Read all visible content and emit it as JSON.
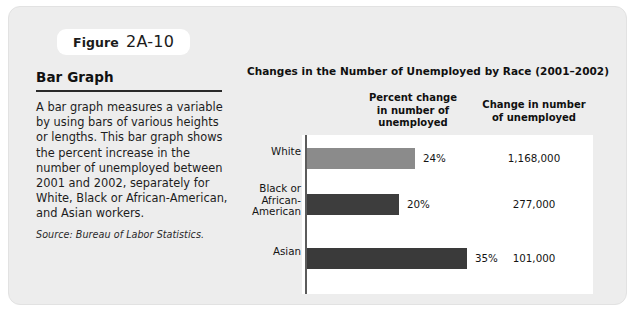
{
  "figure": {
    "label_word": "Figure",
    "number": "2A-10"
  },
  "left_panel": {
    "title": "Bar Graph",
    "body": "A bar graph measures a variable by using bars of various heights or lengths. This bar graph shows the percent increase in the number of unemployed between 2001 and 2002, separately for White, Black or African-American, and Asian workers.",
    "source": "Source: Bureau of Labor Statistics."
  },
  "chart": {
    "title": "Changes in the Number of Unemployed by Race (2001–2002)",
    "column_headers": {
      "percent": "Percent change\nin number of\nunemployed",
      "percent_line1": "Percent change",
      "percent_line2": "in number of",
      "percent_line3": "unemployed",
      "change_line1": "Change in number",
      "change_line2": "of unemployed"
    },
    "rows": [
      {
        "label": "White",
        "label_lines": [
          "White"
        ],
        "percent_label": "24%",
        "percent_value": 24,
        "count_label": "1,168,000",
        "count_value": 1168000,
        "bar_color": "#8b8b8b",
        "bar_length_px": 108
      },
      {
        "label": "Black or African-American",
        "label_lines": [
          "Black or",
          "African-",
          "American"
        ],
        "percent_label": "20%",
        "percent_value": 20,
        "count_label": "277,000",
        "count_value": 277000,
        "bar_color": "#3d3d3d",
        "bar_length_px": 92
      },
      {
        "label": "Asian",
        "label_lines": [
          "Asian"
        ],
        "percent_label": "35%",
        "percent_value": 35,
        "count_label": "101,000",
        "count_value": 101000,
        "bar_color": "#3a3a3a",
        "bar_length_px": 160
      }
    ]
  },
  "chart_data": {
    "type": "bar",
    "orientation": "horizontal",
    "title": "Changes in the Number of Unemployed by Race (2001–2002)",
    "categories": [
      "White",
      "Black or African-American",
      "Asian"
    ],
    "series": [
      {
        "name": "Percent change in number of unemployed",
        "unit": "%",
        "values": [
          24,
          20,
          35
        ],
        "labels": [
          "24%",
          "20%",
          "35%"
        ]
      },
      {
        "name": "Change in number of unemployed",
        "unit": "persons",
        "values": [
          1168000,
          277000,
          101000
        ],
        "labels": [
          "1,168,000",
          "277,000",
          "101,000"
        ],
        "rendered_as": "table"
      }
    ],
    "xlabel": "",
    "ylabel": "",
    "xlim": [
      0,
      40
    ],
    "grid": false,
    "legend": "none",
    "bar_colors": [
      "#8b8b8b",
      "#3d3d3d",
      "#3a3a3a"
    ],
    "note": "Bar lengths are not strictly proportional to the percent values as drawn in the source figure."
  },
  "colors": {
    "card_background": "#ededed",
    "plot_background": "#ffffff",
    "axis": "#5c5c5c",
    "text": "#141414",
    "rule": "#2a2a2a"
  }
}
